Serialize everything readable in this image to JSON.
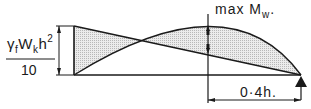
{
  "diagram": {
    "type": "bending moment diagram",
    "labels": {
      "left_fraction_numerator": "γ",
      "left_fraction_numerator_sub1": "f",
      "left_fraction_numerator_mid": "W",
      "left_fraction_numerator_sub2": "k",
      "left_fraction_numerator_end": "h",
      "left_fraction_numerator_sup": "2",
      "left_fraction_denominator": "10",
      "max_moment_prefix": "max M",
      "max_moment_sub": "w",
      "max_moment_suffix": ".",
      "dimension": "0·4h."
    },
    "colors": {
      "line": "#1a1a1a",
      "hatch_fill": "#d4d4d4",
      "background": "#ffffff"
    }
  }
}
